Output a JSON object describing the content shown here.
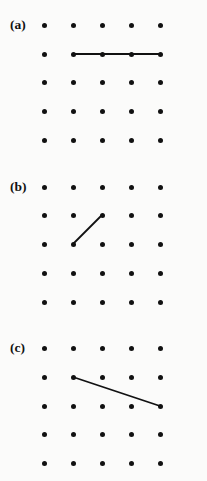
{
  "figure": {
    "background_color": "#fbfbfa",
    "ink_color": "#111111",
    "width": 207,
    "height": 481,
    "grid": {
      "columns": 5,
      "rows": 5,
      "column_x": [
        44,
        73,
        102,
        131,
        160
      ],
      "dot_diameter": 5,
      "spacing": 29
    },
    "panels": [
      {
        "id": "panel-a",
        "label": "(a)",
        "label_x": 10,
        "label_y": 18,
        "row_y": [
          25,
          54,
          82,
          111,
          140
        ],
        "segments": [
          {
            "name": "horizontal-segment",
            "from": {
              "col": 2,
              "row": 2
            },
            "to": {
              "col": 5,
              "row": 2
            },
            "orientation": "horizontal"
          }
        ]
      },
      {
        "id": "panel-b",
        "label": "(b)",
        "label_x": 10,
        "label_y": 180,
        "row_y": [
          187,
          215,
          244,
          273,
          302
        ],
        "segments": [
          {
            "name": "diagonal-segment-up-right",
            "from": {
              "col": 2,
              "row": 3
            },
            "to": {
              "col": 3,
              "row": 2
            },
            "orientation": "diagonal"
          }
        ]
      },
      {
        "id": "panel-c",
        "label": "(c)",
        "label_x": 10,
        "label_y": 341,
        "row_y": [
          348,
          377,
          406,
          434,
          463
        ],
        "segments": [
          {
            "name": "shallow-segment-down-right",
            "from": {
              "col": 2,
              "row": 2
            },
            "to": {
              "col": 5,
              "row": 3
            },
            "orientation": "oblique"
          }
        ]
      }
    ]
  },
  "chart_data": {
    "type": "scatter",
    "title": "",
    "xlabel": "",
    "ylabel": "",
    "panels": [
      {
        "label": "(a)",
        "points": [
          [
            1,
            1
          ],
          [
            2,
            1
          ],
          [
            3,
            1
          ],
          [
            4,
            1
          ],
          [
            5,
            1
          ],
          [
            1,
            2
          ],
          [
            2,
            2
          ],
          [
            3,
            2
          ],
          [
            4,
            2
          ],
          [
            5,
            2
          ],
          [
            1,
            3
          ],
          [
            2,
            3
          ],
          [
            3,
            3
          ],
          [
            4,
            3
          ],
          [
            5,
            3
          ],
          [
            1,
            4
          ],
          [
            2,
            4
          ],
          [
            3,
            4
          ],
          [
            4,
            4
          ],
          [
            5,
            4
          ],
          [
            1,
            5
          ],
          [
            2,
            5
          ],
          [
            3,
            5
          ],
          [
            4,
            5
          ],
          [
            5,
            5
          ]
        ],
        "segment": {
          "x": [
            2,
            5
          ],
          "y": [
            2,
            2
          ]
        }
      },
      {
        "label": "(b)",
        "points": [
          [
            1,
            1
          ],
          [
            2,
            1
          ],
          [
            3,
            1
          ],
          [
            4,
            1
          ],
          [
            5,
            1
          ],
          [
            1,
            2
          ],
          [
            2,
            2
          ],
          [
            3,
            2
          ],
          [
            4,
            2
          ],
          [
            5,
            2
          ],
          [
            1,
            3
          ],
          [
            2,
            3
          ],
          [
            3,
            3
          ],
          [
            4,
            3
          ],
          [
            5,
            3
          ],
          [
            1,
            4
          ],
          [
            2,
            4
          ],
          [
            3,
            4
          ],
          [
            4,
            4
          ],
          [
            5,
            4
          ],
          [
            1,
            5
          ],
          [
            2,
            5
          ],
          [
            3,
            5
          ],
          [
            4,
            5
          ],
          [
            5,
            5
          ]
        ],
        "segment": {
          "x": [
            2,
            3
          ],
          "y": [
            3,
            2
          ]
        }
      },
      {
        "label": "(c)",
        "points": [
          [
            1,
            1
          ],
          [
            2,
            1
          ],
          [
            3,
            1
          ],
          [
            4,
            1
          ],
          [
            5,
            1
          ],
          [
            1,
            2
          ],
          [
            2,
            2
          ],
          [
            3,
            2
          ],
          [
            4,
            2
          ],
          [
            5,
            2
          ],
          [
            1,
            3
          ],
          [
            2,
            3
          ],
          [
            3,
            3
          ],
          [
            4,
            3
          ],
          [
            5,
            3
          ],
          [
            1,
            4
          ],
          [
            2,
            4
          ],
          [
            3,
            4
          ],
          [
            4,
            4
          ],
          [
            5,
            4
          ],
          [
            1,
            5
          ],
          [
            2,
            5
          ],
          [
            3,
            5
          ],
          [
            4,
            5
          ],
          [
            5,
            5
          ]
        ],
        "segment": {
          "x": [
            2,
            5
          ],
          "y": [
            2,
            3
          ]
        }
      }
    ],
    "xlim": [
      1,
      5
    ],
    "ylim": [
      1,
      5
    ],
    "grid": false,
    "legend": null
  }
}
